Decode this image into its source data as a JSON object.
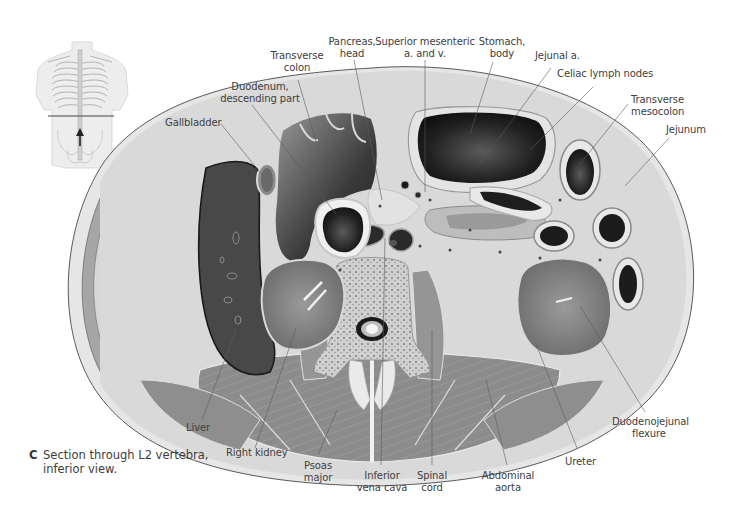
{
  "figure": {
    "caption_letter": "C",
    "caption_line1": "Section through L2 vertebra,",
    "caption_line2": "inferior view.",
    "orientation_inset": {
      "description": "Torso outline with horizontal section line at L2 and upward arrow",
      "arrow_direction": "up"
    }
  },
  "labels": {
    "gallbladder": [
      "Gallbladder"
    ],
    "duodenum": [
      "Duodenum,",
      "descending part"
    ],
    "transverse_colon": [
      "Transverse",
      "colon"
    ],
    "pancreas": [
      "Pancreas,",
      "head"
    ],
    "sma": [
      "Superior mesenteric",
      "a. and v."
    ],
    "stomach": [
      "Stomach,",
      "body"
    ],
    "jejunal_a": [
      "Jejunal a."
    ],
    "celiac": [
      "Celiac lymph nodes"
    ],
    "mesocolon": [
      "Transverse",
      "mesocolon"
    ],
    "jejunum": [
      "Jejunum"
    ],
    "liver": [
      "Liver"
    ],
    "right_kidney": [
      "Right kidney"
    ],
    "psoas": [
      "Psoas",
      "major"
    ],
    "ivc": [
      "Inferior",
      "vena cava"
    ],
    "spinal_cord": [
      "Spinal",
      "cord"
    ],
    "aorta": [
      "Abdominal",
      "aorta"
    ],
    "ureter": [
      "Ureter"
    ],
    "dj_flexure": [
      "Duodenojejunal",
      "flexure"
    ]
  },
  "colors": {
    "background": "#ffffff",
    "label_text": "#404040",
    "leader_line": "#5a5a5a",
    "skin_layer": "#d8d8d8",
    "muscle": "#8a8a8a",
    "liver": "#4a4a4a",
    "kidney": "#7a7a7a",
    "lumen_dark": "#1e1e1e",
    "fat": "#d4d4d4",
    "bone": "#c8c8c8"
  }
}
